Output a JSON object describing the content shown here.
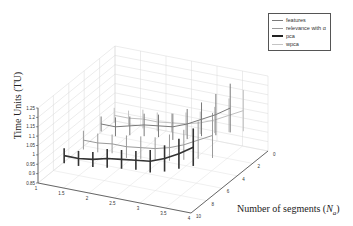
{
  "chart_data": {
    "type": "line",
    "subtype": "3d-errorbar",
    "title": "",
    "ylabel": "Time Units (TU)",
    "xlabel": "Number of segments (N_a)",
    "ylim": [
      0.85,
      1.25
    ],
    "yticks": [
      "1.25",
      "1.2",
      "1.15",
      "1.1",
      "1.05",
      "1",
      "0.95",
      "0.9",
      "0.85"
    ],
    "xticks": [
      "1",
      "1.5",
      "2",
      "2.5",
      "3",
      "3.5",
      "4"
    ],
    "zticks": [
      "10",
      "8",
      "6",
      "4",
      "2",
      "0"
    ],
    "grid": true,
    "legend_position": "top-right",
    "x": [
      1,
      1.3,
      1.6,
      1.9,
      2.2,
      2.5,
      2.8,
      3.1,
      3.4,
      3.7
    ],
    "series": [
      {
        "name": "features",
        "color": "#7a7a7a",
        "values": [
          0.91,
          0.91,
          0.93,
          0.95,
          0.96,
          0.97,
          1.0,
          1.04,
          1.08,
          1.13
        ],
        "err": [
          0.04,
          0.05,
          0.05,
          0.06,
          0.06,
          0.07,
          0.08,
          0.09,
          0.11,
          0.13
        ]
      },
      {
        "name": "relevance with α",
        "color": "#9a9a9a",
        "values": [
          0.9,
          0.9,
          0.91,
          0.91,
          0.92,
          0.93,
          0.95,
          0.98,
          1.02,
          1.06
        ],
        "err": [
          0.05,
          0.05,
          0.05,
          0.06,
          0.06,
          0.06,
          0.07,
          0.08,
          0.1,
          0.12
        ]
      },
      {
        "name": "pca",
        "color": "#333333",
        "values": [
          0.9,
          0.9,
          0.91,
          0.93,
          0.94,
          0.95,
          0.96,
          0.99,
          1.03,
          1.08
        ],
        "err": [
          0.04,
          0.04,
          0.04,
          0.05,
          0.05,
          0.05,
          0.06,
          0.07,
          0.08,
          0.1
        ]
      },
      {
        "name": "wpca",
        "color": "#c0c0c0",
        "values": [
          0.9,
          0.9,
          0.91,
          0.91,
          0.92,
          0.93,
          0.95,
          0.98,
          1.02,
          1.06
        ],
        "err": [
          0.04,
          0.04,
          0.05,
          0.05,
          0.05,
          0.06,
          0.06,
          0.07,
          0.09,
          0.11
        ]
      }
    ]
  },
  "legend": {
    "items": [
      {
        "label": "features",
        "color": "#7a7a7a",
        "width": 1
      },
      {
        "label": "relevance with α",
        "color": "#9a9a9a",
        "width": 1
      },
      {
        "label": "pca",
        "color": "#222222",
        "width": 2
      },
      {
        "label": "wpca",
        "color": "#c4c4c4",
        "width": 1
      }
    ]
  },
  "labels": {
    "ylabel": "Time Units (TU)",
    "xlabel_main": "Number of segments (",
    "xlabel_sym": "N",
    "xlabel_sub": "a",
    "xlabel_end": ")"
  }
}
